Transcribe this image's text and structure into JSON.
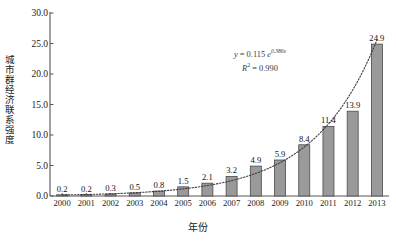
{
  "chart_data": {
    "type": "bar",
    "title": "",
    "subtitle": "",
    "xlabel": "年份",
    "ylabel": "城市群经济联系强度",
    "categories": [
      "2000",
      "2001",
      "2002",
      "2003",
      "2004",
      "2005",
      "2006",
      "2007",
      "2008",
      "2009",
      "2010",
      "2011",
      "2012",
      "2013"
    ],
    "values": [
      0.2,
      0.2,
      0.3,
      0.5,
      0.8,
      1.5,
      2.1,
      3.2,
      4.9,
      5.9,
      8.4,
      11.4,
      13.9,
      24.9
    ],
    "value_labels": [
      "0.2",
      "0.2",
      "0.3",
      "0.5",
      "0.8",
      "1.5",
      "2.1",
      "3.2",
      "4.9",
      "5.9",
      "8.4",
      "11.4",
      "13.9",
      "24.9"
    ],
    "ylim": [
      0,
      30
    ],
    "ytick_values": [
      0,
      5,
      10,
      15,
      20,
      25,
      30
    ],
    "ytick_labels": [
      "0.0",
      "5.0",
      "10.0",
      "15.0",
      "20.0",
      "25.0",
      "30.0"
    ],
    "grid": false,
    "legend": "none",
    "bar_color": "#9a9a9a",
    "bar_edge_color": "#4a4a4a",
    "axis_color": "#555555",
    "trendline": {
      "style": "dotted",
      "color": "#3d3d3d",
      "type": "exponential",
      "coefficient": 0.115,
      "exponent_rate": 0.386
    },
    "annotations": {
      "equation_y": "y",
      "equation_eq": " = 0.115 ",
      "equation_e": "e",
      "equation_exponent": "0.386x",
      "r_squared_symbol": "R",
      "r_squared_sup": "2",
      "r_squared_value": " = 0.990"
    }
  }
}
